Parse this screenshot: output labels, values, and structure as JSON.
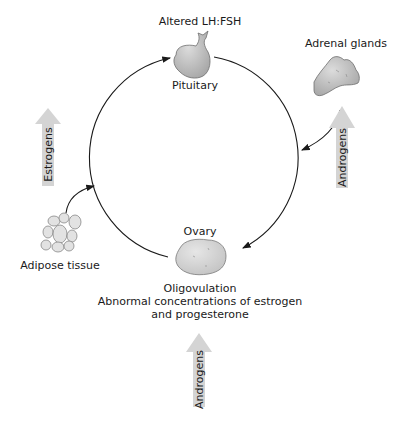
{
  "diagram": {
    "nodes": {
      "pituitary": {
        "top_label": "Altered LH:FSH",
        "label": "Pituitary"
      },
      "adrenal": {
        "label": "Adrenal glands"
      },
      "ovary": {
        "top_label": "Ovary",
        "label_lines": [
          "Oligovulation",
          "Abnormal concentrations of estrogen",
          "and progesterone"
        ]
      },
      "adipose": {
        "label": "Adipose tissue"
      }
    },
    "arrows": {
      "estrogens": {
        "label": "Estrogens"
      },
      "androgens_adrenal": {
        "label": "Androgens"
      },
      "androgens_ovary": {
        "label": "Androgens"
      }
    },
    "colors": {
      "organ_fill": "#c8c8c8",
      "organ_stroke": "#777777",
      "big_arrow_fill": "#d4d4d4",
      "line": "#1a1a1a"
    }
  }
}
